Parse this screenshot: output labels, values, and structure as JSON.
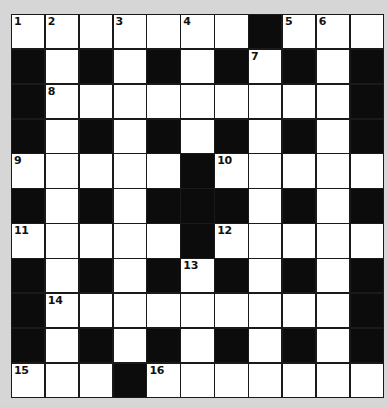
{
  "puzzle": {
    "type": "crossword",
    "rows": 11,
    "cols": 11,
    "colors": {
      "background": "#d6d6d6",
      "block": "#0c0c0c",
      "open": "#ffffff",
      "grid_line": "#1a1a1a"
    },
    "layout": [
      "....... ...",
      " . . . . . ",
      " ......... ",
      " . . . . . ",
      "..... .....",
      " . .   . . ",
      "..... .....",
      " . . . . . ",
      " ......... ",
      " . . . . . ",
      "... ......."
    ],
    "numbers": [
      {
        "row": 0,
        "col": 0,
        "n": "1"
      },
      {
        "row": 0,
        "col": 1,
        "n": "2"
      },
      {
        "row": 0,
        "col": 3,
        "n": "3"
      },
      {
        "row": 0,
        "col": 5,
        "n": "4"
      },
      {
        "row": 0,
        "col": 8,
        "n": "5"
      },
      {
        "row": 0,
        "col": 9,
        "n": "6"
      },
      {
        "row": 1,
        "col": 7,
        "n": "7"
      },
      {
        "row": 2,
        "col": 1,
        "n": "8"
      },
      {
        "row": 4,
        "col": 0,
        "n": "9"
      },
      {
        "row": 4,
        "col": 6,
        "n": "10"
      },
      {
        "row": 6,
        "col": 0,
        "n": "11"
      },
      {
        "row": 6,
        "col": 6,
        "n": "12"
      },
      {
        "row": 7,
        "col": 5,
        "n": "13"
      },
      {
        "row": 8,
        "col": 1,
        "n": "14"
      },
      {
        "row": 10,
        "col": 0,
        "n": "15"
      },
      {
        "row": 10,
        "col": 4,
        "n": "16"
      }
    ]
  }
}
